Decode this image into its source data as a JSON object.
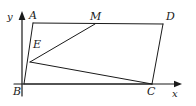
{
  "figure": {
    "kind": "geometry-diagram",
    "width": 196,
    "height": 106,
    "background_color": "#ffffff",
    "stroke_color": "#1a1a1a",
    "label_color": "#1a1a1a"
  },
  "axes": {
    "x_label": "x",
    "y_label": "y",
    "origin": {
      "x": 24,
      "y": 84
    },
    "x_axis": {
      "x1": 14,
      "y1": 84,
      "x2": 182,
      "y2": 84
    },
    "y_axis": {
      "x1": 22,
      "y1": 96,
      "x2": 22,
      "y2": 11
    },
    "x_label_pos": {
      "x": 172,
      "y": 89
    },
    "y_label_pos": {
      "x": 7,
      "y": 12
    }
  },
  "points": {
    "A": {
      "label": "A",
      "x": 33,
      "y": 23,
      "label_x": 29,
      "label_y": 10
    },
    "B": {
      "label": "B",
      "x": 24,
      "y": 84,
      "label_x": 13,
      "label_y": 86
    },
    "C": {
      "label": "C",
      "x": 152,
      "y": 84,
      "label_x": 147,
      "label_y": 86
    },
    "D": {
      "label": "D",
      "x": 163,
      "y": 24,
      "label_x": 166,
      "label_y": 11
    },
    "E": {
      "label": "E",
      "x": 30,
      "y": 62,
      "label_x": 33,
      "label_y": 39
    },
    "M": {
      "label": "M",
      "x": 95,
      "y": 24,
      "label_x": 90,
      "label_y": 11
    }
  },
  "segments": [
    {
      "name": "segment-AD",
      "from": "A",
      "to": "D"
    },
    {
      "name": "segment-AB",
      "from": "A",
      "to": "B"
    },
    {
      "name": "segment-DC",
      "from": "D",
      "to": "C"
    },
    {
      "name": "segment-BC",
      "from": "B",
      "to": "C"
    },
    {
      "name": "segment-EM",
      "from": "E",
      "to": "M"
    },
    {
      "name": "segment-EC",
      "from": "E",
      "to": "C"
    }
  ]
}
